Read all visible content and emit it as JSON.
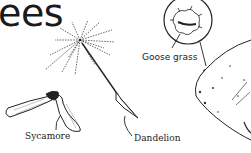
{
  "title": "ees",
  "labels": {
    "goose_grass": "Goose grass",
    "sycamore": "Sycamore",
    "dandelion": "Dandelion"
  },
  "illustrations": [
    "dandelion-seed",
    "sycamore-seed",
    "goose-grass-burr",
    "arm-sleeve"
  ],
  "colors": {
    "ink": "#1a1a1a",
    "background": "#ffffff"
  }
}
